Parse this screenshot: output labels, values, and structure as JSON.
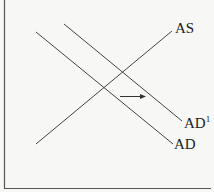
{
  "diagram": {
    "type": "aggregate-supply-demand",
    "colors": {
      "line": "#444444",
      "frame": "#555555",
      "background": "#f7f7f6",
      "text": "#222222"
    },
    "curves": [
      {
        "id": "as",
        "label": "AS",
        "x1": 36,
        "y1": 144,
        "x2": 172,
        "y2": 31
      },
      {
        "id": "ad",
        "label": "AD",
        "x1": 36,
        "y1": 32,
        "x2": 173,
        "y2": 144
      },
      {
        "id": "ad1",
        "label": "AD",
        "label_sup": "1",
        "x1": 64,
        "y1": 24,
        "x2": 182,
        "y2": 121
      }
    ],
    "arrow": {
      "direction": "right",
      "x1": 120,
      "y1": 96,
      "x2": 146,
      "y2": 96
    }
  },
  "labels": {
    "as": "AS",
    "ad": "AD",
    "ad1": "AD",
    "ad1_sup": "1"
  }
}
